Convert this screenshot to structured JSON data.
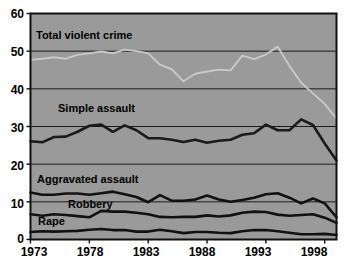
{
  "chart_data": {
    "type": "line",
    "title": "",
    "xlabel": "",
    "ylabel": "",
    "xlim": [
      1973,
      1999
    ],
    "ylim": [
      0,
      60
    ],
    "yticks": [
      0,
      10,
      20,
      30,
      40,
      50,
      60
    ],
    "xticks": [
      1973,
      1978,
      1983,
      1988,
      1993,
      1998
    ],
    "grid": "horizontal",
    "legend": "inline-labels",
    "plot_background": "#9a9a9a",
    "x": [
      1973,
      1974,
      1975,
      1976,
      1977,
      1978,
      1979,
      1980,
      1981,
      1982,
      1983,
      1984,
      1985,
      1986,
      1987,
      1988,
      1989,
      1990,
      1991,
      1992,
      1993,
      1994,
      1995,
      1996,
      1997,
      1998,
      1999
    ],
    "series": [
      {
        "name": "Total violent crime",
        "color": "#c9c9c9",
        "values": [
          47.7,
          48.0,
          48.4,
          48.0,
          49.0,
          49.4,
          49.9,
          49.4,
          50.4,
          50.0,
          49.4,
          46.4,
          45.2,
          42.0,
          44.0,
          44.6,
          45.1,
          44.9,
          48.8,
          47.9,
          49.1,
          51.2,
          46.1,
          41.6,
          38.8,
          36.0,
          32.1
        ]
      },
      {
        "name": "Simple assault",
        "color": "#1a1a1a",
        "values": [
          26.1,
          25.8,
          27.2,
          27.3,
          28.6,
          30.2,
          30.5,
          28.6,
          30.3,
          29.0,
          26.9,
          26.9,
          26.5,
          25.9,
          26.5,
          25.7,
          26.2,
          26.5,
          27.8,
          28.2,
          30.5,
          29.0,
          29.0,
          31.9,
          30.4,
          25.5,
          21.0
        ]
      },
      {
        "name": "Aggravated assault",
        "color": "#111111",
        "values": [
          12.5,
          11.9,
          11.9,
          12.2,
          12.2,
          11.9,
          12.3,
          12.7,
          12.0,
          11.3,
          9.9,
          11.8,
          10.3,
          10.3,
          10.6,
          11.7,
          10.6,
          10.0,
          10.5,
          11.1,
          12.0,
          12.3,
          11.1,
          9.6,
          10.9,
          9.6,
          5.9
        ]
      },
      {
        "name": "Robbery",
        "color": "#111111",
        "values": [
          6.7,
          6.3,
          6.7,
          6.5,
          6.2,
          5.9,
          7.6,
          7.4,
          7.4,
          7.1,
          6.7,
          6.0,
          5.9,
          6.0,
          6.0,
          6.4,
          6.1,
          6.4,
          7.1,
          7.4,
          7.3,
          6.6,
          6.3,
          6.5,
          6.7,
          5.8,
          4.4
        ]
      },
      {
        "name": "Rape",
        "color": "#111111",
        "values": [
          2.0,
          2.2,
          2.1,
          2.2,
          2.3,
          2.6,
          2.8,
          2.5,
          2.5,
          2.1,
          2.1,
          2.6,
          2.2,
          1.7,
          2.0,
          2.0,
          1.8,
          1.7,
          2.2,
          2.5,
          2.5,
          2.2,
          1.8,
          1.4,
          1.4,
          1.5,
          1.2
        ]
      }
    ],
    "series_labels": [
      {
        "text": "Total violent crime",
        "x": 36,
        "y": 30
      },
      {
        "text": "Simple assault",
        "x": 58,
        "y": 103
      },
      {
        "text": "Aggravated assault",
        "x": 37,
        "y": 174
      },
      {
        "text": "Robbery",
        "x": 68,
        "y": 199
      },
      {
        "text": "Rape",
        "x": 38,
        "y": 216
      }
    ],
    "ytick_labels": [
      {
        "text": "60",
        "y": 8
      },
      {
        "text": "50",
        "y": 46
      },
      {
        "text": "40",
        "y": 84
      },
      {
        "text": "30",
        "y": 122
      },
      {
        "text": "20",
        "y": 160
      },
      {
        "text": "10",
        "y": 198
      },
      {
        "text": "0",
        "y": 233
      }
    ],
    "xtick_labels": [
      {
        "text": "1973",
        "x": 12
      },
      {
        "text": "1978",
        "x": 68
      },
      {
        "text": "1983",
        "x": 124
      },
      {
        "text": "1988",
        "x": 180
      },
      {
        "text": "1993",
        "x": 236
      },
      {
        "text": "1998",
        "x": 292
      }
    ]
  }
}
